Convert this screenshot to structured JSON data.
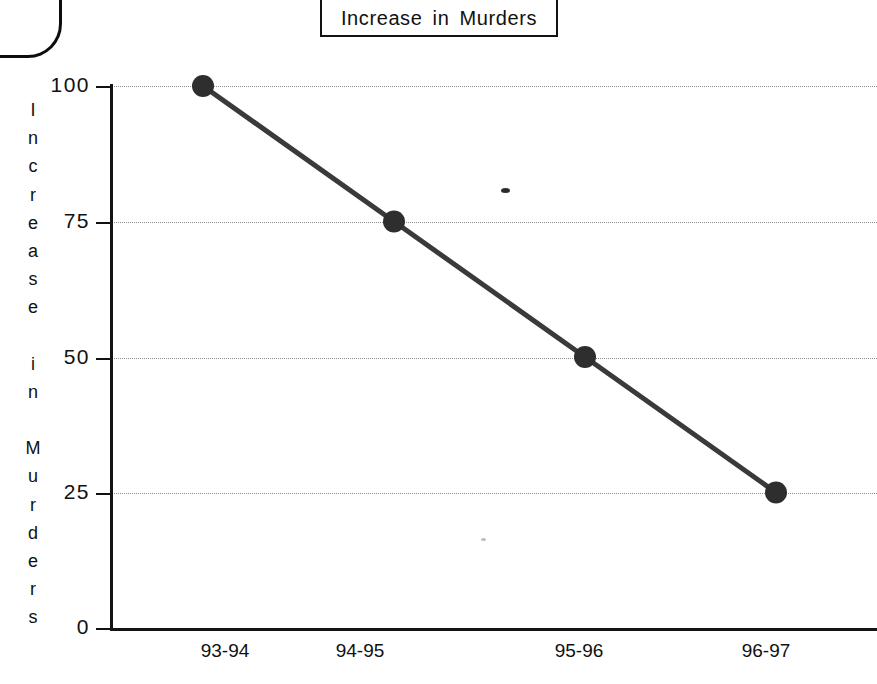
{
  "chart_data": {
    "type": "line",
    "title": "Increase in Murders",
    "xlabel": "",
    "ylabel": "Increase in Murders",
    "categories": [
      "93-94",
      "94-95",
      "95-96",
      "96-97"
    ],
    "values": [
      100,
      75,
      50,
      25
    ],
    "series": [
      {
        "name": "Increase in Murders",
        "values": [
          100,
          75,
          50,
          25
        ]
      }
    ],
    "ylim": [
      0,
      100
    ],
    "ytick_labels": [
      "100",
      "75",
      "50",
      "25",
      "0"
    ],
    "ytick_values": [
      100,
      75,
      50,
      25,
      0
    ],
    "grid": true,
    "grid_style": "dotted-horizontal",
    "legend": "none",
    "marker": "filled-circle",
    "line_color": "#3a3a3a",
    "marker_color": "#2e2e2e",
    "axis_color": "#141414",
    "grid_color": "#8c8c8c",
    "background": "#ffffff"
  },
  "title_box": {
    "label": "Increase in Murders"
  },
  "y_axis": {
    "title_letters": [
      "I",
      "n",
      "c",
      "r",
      "e",
      "a",
      "s",
      "e",
      " ",
      "i",
      "n",
      " ",
      "M",
      "u",
      "r",
      "d",
      "e",
      "r",
      "s"
    ],
    "ticks": [
      {
        "label": "100",
        "value": 100
      },
      {
        "label": "75",
        "value": 75
      },
      {
        "label": "50",
        "value": 50
      },
      {
        "label": "25",
        "value": 25
      },
      {
        "label": "0",
        "value": 0
      }
    ]
  },
  "x_axis": {
    "ticks": [
      {
        "label": "93-94"
      },
      {
        "label": "94-95"
      },
      {
        "label": "95-96"
      },
      {
        "label": "96-97"
      }
    ]
  },
  "points": [
    {
      "label": "93-94",
      "value": 100
    },
    {
      "label": "94-95",
      "value": 75
    },
    {
      "label": "95-96",
      "value": 50
    },
    {
      "label": "96-97",
      "value": 25
    }
  ]
}
